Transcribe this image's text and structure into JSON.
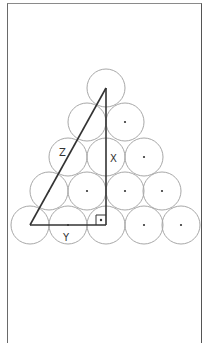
{
  "figure": {
    "labels": {
      "hypotenuse": "Z",
      "vertical_leg": "X",
      "horizontal_leg": "Y"
    },
    "circle_radius": 19,
    "rows": [
      {
        "row": 1,
        "centers": [
          [
            106,
            88
          ]
        ]
      },
      {
        "row": 2,
        "centers": [
          [
            87,
            122
          ],
          [
            125,
            122
          ]
        ]
      },
      {
        "row": 3,
        "centers": [
          [
            68,
            157
          ],
          [
            106,
            157
          ],
          [
            144,
            157
          ]
        ]
      },
      {
        "row": 4,
        "centers": [
          [
            49,
            191
          ],
          [
            87,
            191
          ],
          [
            125,
            191
          ],
          [
            162,
            191
          ]
        ]
      },
      {
        "row": 5,
        "centers": [
          [
            30,
            225
          ],
          [
            68,
            225
          ],
          [
            106,
            225
          ],
          [
            144,
            225
          ],
          [
            181,
            225
          ]
        ]
      }
    ],
    "triangle": {
      "apex": [
        106,
        88
      ],
      "bottom_left": [
        30,
        225
      ],
      "right_angle": [
        106,
        225
      ]
    },
    "colors": {
      "circle_stroke": "#a8a8a8",
      "triangle_stroke": "#333333",
      "frame": "#666666"
    }
  }
}
